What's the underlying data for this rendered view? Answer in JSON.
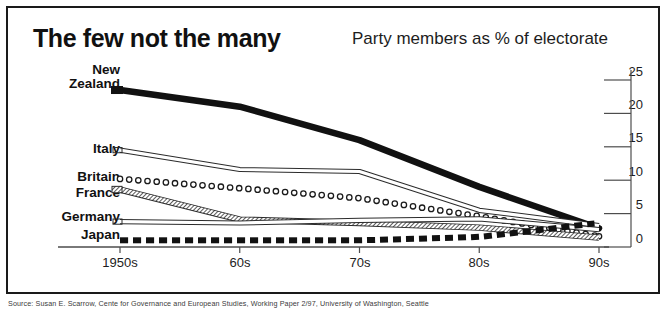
{
  "title": "The few not the many",
  "subtitle": "Party members as % of electorate",
  "footnote": "Source: Susan E. Scarrow, Cente for Governance and European Studies, Working Paper 2/97, University of Washington, Seattle",
  "chart_data": {
    "type": "line",
    "title": "The few not the many",
    "subtitle": "Party members as % of electorate",
    "xlabel": "",
    "ylabel": "Party members as % of electorate",
    "x": [
      "1950s",
      "60s",
      "70s",
      "80s",
      "90s"
    ],
    "xtick_labels": [
      "1950s",
      "60s",
      "70s",
      "80s",
      "90s"
    ],
    "ytick_labels": [
      "0",
      "5",
      "10",
      "15",
      "20",
      "25"
    ],
    "ytick_values": [
      0,
      5,
      10,
      15,
      20,
      25
    ],
    "ylim": [
      0,
      25
    ],
    "grid": false,
    "legend_position": "left-inline",
    "series": [
      {
        "name": "New Zealand",
        "style": "thick-solid-black",
        "color": "#111111",
        "values": [
          23.5,
          21.0,
          16.0,
          9.0,
          2.8
        ]
      },
      {
        "name": "Italy",
        "style": "thin-outline",
        "color": "#2b2b2b",
        "values": [
          14.5,
          11.6,
          11.3,
          5.5,
          3.2
        ]
      },
      {
        "name": "Britain",
        "style": "open-circles",
        "color": "#1a1a1a",
        "values": [
          10.2,
          8.8,
          7.3,
          4.6,
          1.6
        ]
      },
      {
        "name": "France",
        "style": "hatched-band",
        "color": "#4a4a4a",
        "values": [
          8.6,
          4.1,
          3.6,
          2.9,
          1.4
        ]
      },
      {
        "name": "Germany",
        "style": "thin-outline",
        "color": "#2b2b2b",
        "values": [
          3.8,
          3.6,
          4.0,
          4.2,
          2.6
        ]
      },
      {
        "name": "Japan",
        "style": "thick-dashed-black",
        "color": "#111111",
        "values": [
          1.0,
          1.0,
          1.0,
          1.5,
          3.6
        ]
      }
    ]
  }
}
